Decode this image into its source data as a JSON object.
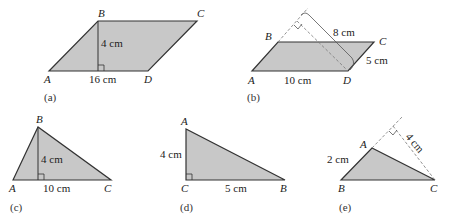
{
  "fill_color": "#c8c8c8",
  "stroke_color": "#333333",
  "figures": [
    {
      "caption": "(a)",
      "shape": "parallelogram",
      "vertices": [
        "A",
        "B",
        "C",
        "D"
      ],
      "height_label": "4 cm",
      "base_label": "16 cm"
    },
    {
      "caption": "(b)",
      "shape": "parallelogram",
      "vertices": [
        "A",
        "B",
        "C",
        "D"
      ],
      "height_label": "8 cm",
      "base_label": "10 cm",
      "side_label": "5 cm"
    },
    {
      "caption": "(c)",
      "shape": "triangle",
      "vertices": [
        "A",
        "B",
        "C"
      ],
      "height_label": "4 cm",
      "base_label": "10 cm"
    },
    {
      "caption": "(d)",
      "shape": "right-triangle",
      "vertices": [
        "A",
        "C",
        "B"
      ],
      "height_label": "4 cm",
      "base_label": "5 cm"
    },
    {
      "caption": "(e)",
      "shape": "triangle",
      "vertices": [
        "A",
        "B",
        "C"
      ],
      "side_label": "2 cm",
      "height_label": "4 cm"
    }
  ]
}
